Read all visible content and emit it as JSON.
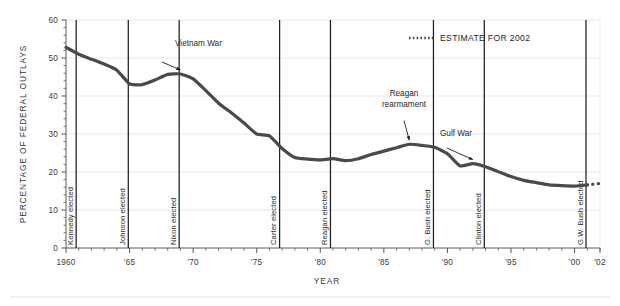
{
  "chart_data": {
    "type": "line",
    "title": "",
    "xlabel": "YEAR",
    "ylabel": "PERCENTAGE OF FEDERAL OUTLAYS",
    "xlim": [
      1960,
      2002
    ],
    "ylim": [
      0,
      60
    ],
    "grid": true,
    "legend_position": "top-right",
    "y_ticks": [
      "0",
      "10",
      "20",
      "30",
      "40",
      "50",
      "60"
    ],
    "y_tick_values": [
      0,
      10,
      20,
      30,
      40,
      50,
      60
    ],
    "x_ticks": [
      "1960",
      "'65",
      "'70",
      "'75",
      "'80",
      "'85",
      "'90",
      "'95",
      "'00",
      "'02"
    ],
    "x_tick_values": [
      1960,
      1965,
      1970,
      1975,
      1980,
      1985,
      1990,
      1995,
      2000,
      2002
    ],
    "series": [
      {
        "name": "Defense share of federal outlays",
        "style": "solid",
        "color": "#4a4a4a",
        "x": [
          1960,
          1961,
          1962,
          1963,
          1964,
          1965,
          1966,
          1967,
          1968,
          1969,
          1970,
          1971,
          1972,
          1973,
          1974,
          1975,
          1976,
          1977,
          1978,
          1979,
          1980,
          1981,
          1982,
          1983,
          1984,
          1985,
          1986,
          1987,
          1988,
          1989,
          1990,
          1991,
          1992,
          1993,
          1994,
          1995,
          1996,
          1997,
          1998,
          1999,
          2000,
          2001
        ],
        "values": [
          52.8,
          51.0,
          49.7,
          48.4,
          46.8,
          43.2,
          43.0,
          44.2,
          45.7,
          45.8,
          44.5,
          41.4,
          38.1,
          35.6,
          32.9,
          30.0,
          29.5,
          26.2,
          23.8,
          23.4,
          23.2,
          23.5,
          23.0,
          23.5,
          24.6,
          25.5,
          26.4,
          27.3,
          27.0,
          26.5,
          24.8,
          21.6,
          22.2,
          21.4,
          20.1,
          18.8,
          17.8,
          17.2,
          16.6,
          16.4,
          16.3,
          16.6
        ]
      },
      {
        "name": "ESTIMATE FOR 2002",
        "style": "dotted",
        "color": "#4a4a4a",
        "x": [
          2001,
          2002
        ],
        "values": [
          16.6,
          17.0
        ]
      }
    ],
    "event_lines": [
      {
        "label": "Kennedy elected",
        "year": 1960.8
      },
      {
        "label": "Johnson elected",
        "year": 1964.9
      },
      {
        "label": "Nixon elected",
        "year": 1968.9
      },
      {
        "label": "Carter elected",
        "year": 1976.8
      },
      {
        "label": "Reagan elected",
        "year": 1980.8
      },
      {
        "label": "G. Bush elected",
        "year": 1988.9
      },
      {
        "label": "Clinton elected",
        "year": 1992.9
      },
      {
        "label": "G.W. Bush elected",
        "year": 2000.9
      }
    ],
    "annotations": [
      {
        "label": "Vietnam War",
        "lines": [
          "Vietnam War"
        ],
        "point_year": 1969,
        "point_value": 45.8
      },
      {
        "label": "Reagan rearmament",
        "lines": [
          "Reagan",
          "rearmament"
        ],
        "point_year": 1987,
        "point_value": 27.3
      },
      {
        "label": "Gulf War",
        "lines": [
          "Gulf War"
        ],
        "point_year": 1992,
        "point_value": 22.2
      }
    ],
    "legend": [
      {
        "label": "ESTIMATE FOR 2002",
        "style": "dotted"
      }
    ]
  },
  "colors": {
    "line": "#4a4a4a",
    "grid": "#e9e9ec",
    "axis": "#5a5a5a",
    "event_line": "#1f1f1f",
    "text": "#2d2d2d",
    "rule": "#e3e3e6",
    "background": "#ffffff"
  }
}
